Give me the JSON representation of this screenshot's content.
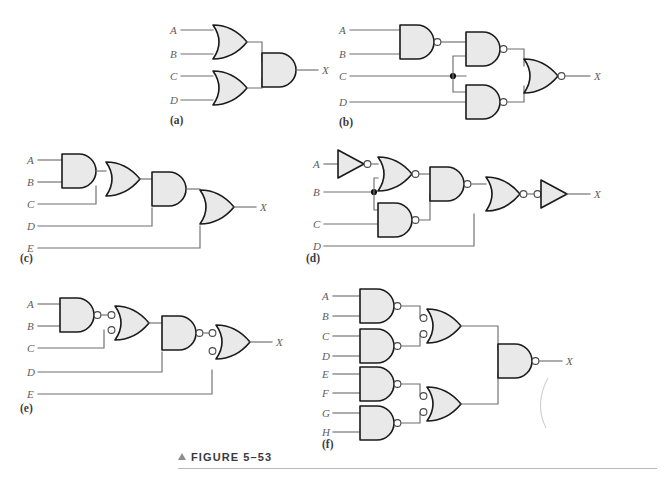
{
  "figure": {
    "caption_marker": "▲",
    "caption_label": "FIGURE 5–53",
    "panel_labels": [
      "(a)",
      "(b)",
      "(c)",
      "(d)",
      "(e)",
      "(f)"
    ],
    "output_label": "X",
    "colors": {
      "gate_fill": "#e9e9e9",
      "gate_stroke": "#1a1a1a",
      "wire": "#6e6e72",
      "label_text": "#5d5d62",
      "caption_text": "#3a3a3e"
    }
  },
  "panels": [
    {
      "id": "a",
      "label": "(a)",
      "inputs": [
        "A",
        "B",
        "C",
        "D"
      ],
      "output": "X",
      "gates": [
        {
          "name": "or-gate-ab",
          "type": "OR",
          "inputs": [
            "A",
            "B"
          ]
        },
        {
          "name": "or-gate-cd",
          "type": "OR",
          "inputs": [
            "C",
            "D"
          ]
        },
        {
          "name": "and-gate-out",
          "type": "AND",
          "inputs": [
            "or-gate-ab",
            "or-gate-cd"
          ],
          "output": "X"
        }
      ],
      "junctions": 0
    },
    {
      "id": "b",
      "label": "(b)",
      "inputs": [
        "A",
        "B",
        "C",
        "D"
      ],
      "output": "X",
      "gates": [
        {
          "name": "nand-gate-ab",
          "type": "NAND",
          "inputs": [
            "A",
            "B"
          ]
        },
        {
          "name": "nand-gate-top",
          "type": "NAND",
          "inputs": [
            "nand-gate-ab",
            "C"
          ]
        },
        {
          "name": "nand-gate-bottom",
          "type": "NAND",
          "inputs": [
            "C",
            "D"
          ]
        },
        {
          "name": "nor-gate-out",
          "type": "NOR",
          "inputs": [
            "nand-gate-top",
            "nand-gate-bottom"
          ],
          "output": "X"
        }
      ],
      "junctions": 1
    },
    {
      "id": "c",
      "label": "(c)",
      "inputs": [
        "A",
        "B",
        "C",
        "D",
        "E"
      ],
      "output": "X",
      "gates": [
        {
          "name": "and-gate-ab",
          "type": "AND",
          "inputs": [
            "A",
            "B"
          ]
        },
        {
          "name": "or-gate-c",
          "type": "OR",
          "inputs": [
            "and-gate-ab",
            "C"
          ]
        },
        {
          "name": "and-gate-d",
          "type": "AND",
          "inputs": [
            "or-gate-c",
            "D"
          ]
        },
        {
          "name": "or-gate-out",
          "type": "OR",
          "inputs": [
            "and-gate-d",
            "E"
          ],
          "output": "X"
        }
      ],
      "junctions": 0
    },
    {
      "id": "d",
      "label": "(d)",
      "inputs": [
        "A",
        "B",
        "C",
        "D"
      ],
      "output": "X",
      "gates": [
        {
          "name": "inverter-a",
          "type": "INVERTER",
          "inputs": [
            "A"
          ]
        },
        {
          "name": "nor-gate-top",
          "type": "NOR",
          "inputs": [
            "inverter-a",
            "B"
          ]
        },
        {
          "name": "nand-gate-bc",
          "type": "NAND",
          "inputs": [
            "B",
            "C"
          ]
        },
        {
          "name": "nand-gate-mid",
          "type": "NAND",
          "inputs": [
            "nor-gate-top",
            "nand-gate-bc"
          ]
        },
        {
          "name": "nor-gate-d",
          "type": "NOR",
          "inputs": [
            "nand-gate-mid",
            "D"
          ]
        },
        {
          "name": "inverter-out",
          "type": "INVERTER-INPUT-BUBBLE",
          "inputs": [
            "nor-gate-d"
          ],
          "output": "X"
        }
      ],
      "junctions": 1
    },
    {
      "id": "e",
      "label": "(e)",
      "inputs": [
        "A",
        "B",
        "C",
        "D",
        "E"
      ],
      "output": "X",
      "gates": [
        {
          "name": "nand-gate-ab",
          "type": "NAND",
          "inputs": [
            "A",
            "B"
          ]
        },
        {
          "name": "neg-or-gate-c",
          "type": "NEG-OR",
          "inputs": [
            "nand-gate-ab",
            "C"
          ]
        },
        {
          "name": "nand-gate-d",
          "type": "NAND",
          "inputs": [
            "neg-or-gate-c",
            "D"
          ]
        },
        {
          "name": "neg-or-gate-out",
          "type": "NEG-OR",
          "inputs": [
            "nand-gate-d",
            "E"
          ],
          "output": "X"
        }
      ],
      "junctions": 0
    },
    {
      "id": "f",
      "label": "(f)",
      "inputs": [
        "A",
        "B",
        "C",
        "D",
        "E",
        "F",
        "G",
        "H"
      ],
      "output": "X",
      "gates": [
        {
          "name": "nand-gate-ab",
          "type": "NAND",
          "inputs": [
            "A",
            "B"
          ]
        },
        {
          "name": "nand-gate-cd",
          "type": "NAND",
          "inputs": [
            "C",
            "D"
          ]
        },
        {
          "name": "nand-gate-ef",
          "type": "NAND",
          "inputs": [
            "E",
            "F"
          ]
        },
        {
          "name": "nand-gate-gh",
          "type": "NAND",
          "inputs": [
            "G",
            "H"
          ]
        },
        {
          "name": "neg-or-gate-top",
          "type": "NEG-OR",
          "inputs": [
            "nand-gate-ab",
            "nand-gate-cd"
          ]
        },
        {
          "name": "neg-or-gate-bottom",
          "type": "NEG-OR",
          "inputs": [
            "nand-gate-ef",
            "nand-gate-gh"
          ]
        },
        {
          "name": "nand-gate-out",
          "type": "NAND",
          "inputs": [
            "neg-or-gate-top",
            "neg-or-gate-bottom"
          ],
          "output": "X"
        }
      ],
      "junctions": 0
    }
  ]
}
